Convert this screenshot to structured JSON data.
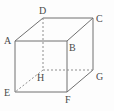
{
  "figure": {
    "name": "cube-diagram",
    "type": "geometric-solid",
    "shape": "cube",
    "projection": "oblique",
    "background_color": "#fdfdfd",
    "stroke_color": "#707070",
    "hidden_stroke_color": "#8e8e8e",
    "label_color": "#4a4a4a",
    "stroke_width": 1,
    "hidden_dash_pattern": "2,2"
  },
  "vertices": [
    {
      "id": "A",
      "label": "A",
      "x": 15,
      "y": 41,
      "face": "front",
      "label_x": 4,
      "label_y": 36
    },
    {
      "id": "B",
      "label": "B",
      "x": 67,
      "y": 41,
      "face": "front",
      "label_x": 69,
      "label_y": 43
    },
    {
      "id": "C",
      "label": "C",
      "x": 93,
      "y": 18,
      "face": "back",
      "label_x": 96,
      "label_y": 14
    },
    {
      "id": "D",
      "label": "D",
      "x": 43,
      "y": 18,
      "face": "back",
      "label_x": 39,
      "label_y": 6
    },
    {
      "id": "E",
      "label": "E",
      "x": 15,
      "y": 92,
      "face": "front",
      "label_x": 4,
      "label_y": 88
    },
    {
      "id": "F",
      "label": "F",
      "x": 67,
      "y": 92,
      "face": "front",
      "label_x": 65,
      "label_y": 95
    },
    {
      "id": "G",
      "label": "G",
      "x": 93,
      "y": 70,
      "face": "back",
      "label_x": 96,
      "label_y": 72
    },
    {
      "id": "H",
      "label": "H",
      "x": 43,
      "y": 70,
      "face": "back",
      "label_x": 37,
      "label_y": 73
    }
  ],
  "edges": [
    {
      "from": "A",
      "to": "B",
      "hidden": false,
      "name": "edge-ab"
    },
    {
      "from": "B",
      "to": "F",
      "hidden": false,
      "name": "edge-bf"
    },
    {
      "from": "F",
      "to": "E",
      "hidden": false,
      "name": "edge-fe"
    },
    {
      "from": "E",
      "to": "A",
      "hidden": false,
      "name": "edge-ea"
    },
    {
      "from": "D",
      "to": "C",
      "hidden": false,
      "name": "edge-dc"
    },
    {
      "from": "C",
      "to": "G",
      "hidden": false,
      "name": "edge-cg"
    },
    {
      "from": "A",
      "to": "D",
      "hidden": false,
      "name": "edge-ad"
    },
    {
      "from": "B",
      "to": "C",
      "hidden": false,
      "name": "edge-bc"
    },
    {
      "from": "F",
      "to": "G",
      "hidden": false,
      "name": "edge-fg"
    },
    {
      "from": "D",
      "to": "H",
      "hidden": true,
      "name": "edge-dh"
    },
    {
      "from": "H",
      "to": "G",
      "hidden": true,
      "name": "edge-hg"
    },
    {
      "from": "H",
      "to": "E",
      "hidden": true,
      "name": "edge-he"
    }
  ]
}
